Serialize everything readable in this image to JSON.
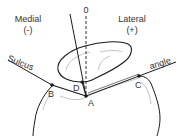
{
  "labels": {
    "medial": "Medial",
    "medial_sign": "(-)",
    "lateral": "Lateral",
    "lateral_sign": "(+)",
    "zero": "0",
    "sulcus": "Sulcus",
    "angle": "angle",
    "point_a": "A",
    "point_b": "B",
    "point_c": "C",
    "point_d": "D"
  },
  "colors": {
    "line": "#1a1a1a",
    "light_line": "#9a9a9a",
    "text": "#333333",
    "background": "#ffffff"
  }
}
